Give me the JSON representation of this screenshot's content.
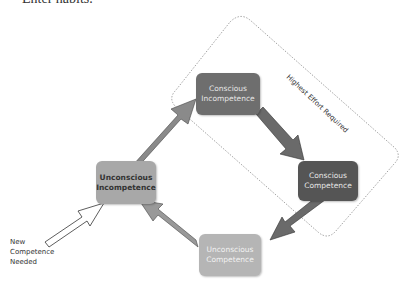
{
  "heading": "Enter habits.",
  "boundary": {
    "label": "Highest Effort Required"
  },
  "stages": [
    {
      "label": "Unconscious Incompetence",
      "color": "#a8a8a8",
      "text_color": "#333333"
    },
    {
      "label": "Conscious Incompetence",
      "color": "#6e6e6e",
      "text_color": "#e6e6e6"
    },
    {
      "label": "Conscious Competence",
      "color": "#555555",
      "text_color": "#e6e6e6"
    },
    {
      "label": "Unconscious Competence",
      "color": "#b5b5b5",
      "text_color": "#f2f2f2"
    }
  ],
  "entry": {
    "label": "New Competence Needed"
  },
  "colors": {
    "arrow_dark": "#6a6a6a",
    "arrow_light": "#999999",
    "dotted_border": "#999999"
  }
}
